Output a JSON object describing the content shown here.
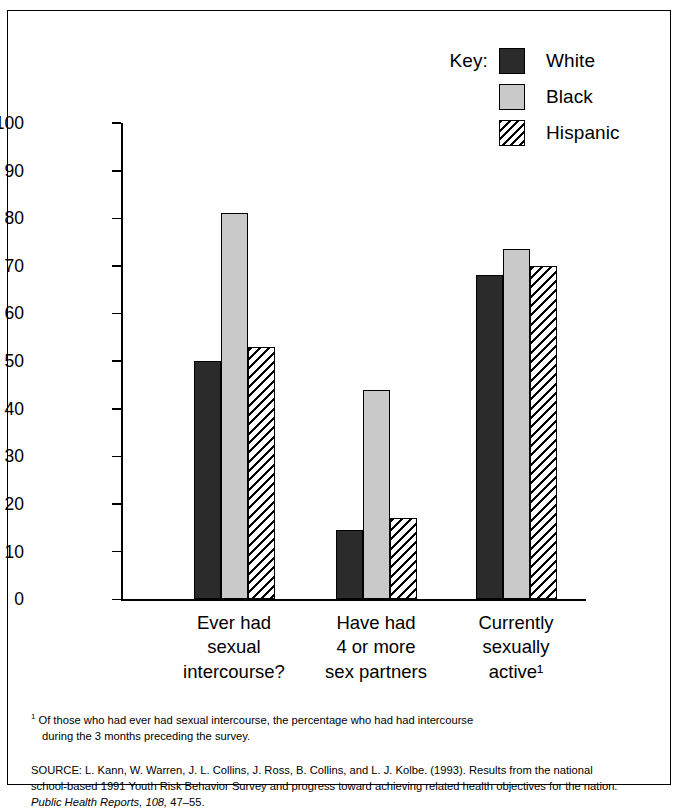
{
  "legend": {
    "key_label": "Key:",
    "entries": [
      {
        "name": "White",
        "swatch": "solid-dark-square-icon"
      },
      {
        "name": "Black",
        "swatch": "solid-lightgray-square-icon"
      },
      {
        "name": "Hispanic",
        "swatch": "diagonal-hatch-square-icon"
      }
    ]
  },
  "chart_data": {
    "type": "bar",
    "title": "",
    "xlabel": "",
    "ylabel": "",
    "ylim": [
      0,
      100
    ],
    "grid": false,
    "legend_position": "top-right",
    "categories": [
      "Ever had sexual intercourse?",
      "Have had 4 or more sex partners",
      "Currently sexually active¹"
    ],
    "category_lines": [
      [
        "Ever had",
        "sexual",
        "intercourse?"
      ],
      [
        "Have had",
        "4 or more",
        "sex partners"
      ],
      [
        "Currently",
        "sexually",
        "active¹"
      ]
    ],
    "yticks": [
      0,
      10,
      20,
      30,
      40,
      50,
      60,
      70,
      80,
      90,
      100
    ],
    "ytick_labels": [
      "0",
      "10",
      "20",
      "30",
      "40",
      "50",
      "60",
      "70",
      "80",
      "90",
      "100"
    ],
    "series": [
      {
        "name": "White",
        "values": [
          50,
          14.5,
          68
        ]
      },
      {
        "name": "Black",
        "values": [
          81,
          44,
          73.5
        ]
      },
      {
        "name": "Hispanic",
        "values": [
          53,
          17,
          70
        ]
      }
    ]
  },
  "notes": {
    "footnote_marker": "1",
    "footnote_line1": "Of those who had ever had sexual intercourse, the percentage who had had intercourse",
    "footnote_line2": "during the 3 months preceding the survey.",
    "source_pre": "SOURCE: L. Kann, W. Warren, J. L. Collins, J. Ross, B. Collins, and L. J. Kolbe. (1993). Results from the national school-based 1991 Youth Risk Behavior Survey and progress toward achieving related health objectives for the nation. ",
    "source_italic": "Public Health Reports, 108,",
    "source_post": " 47–55."
  },
  "colors": {
    "white_series": "#2b2b2b",
    "black_series": "#c9c9c9",
    "hispanic_series": "#ffffff",
    "axis": "#000000",
    "background": "#ffffff"
  }
}
